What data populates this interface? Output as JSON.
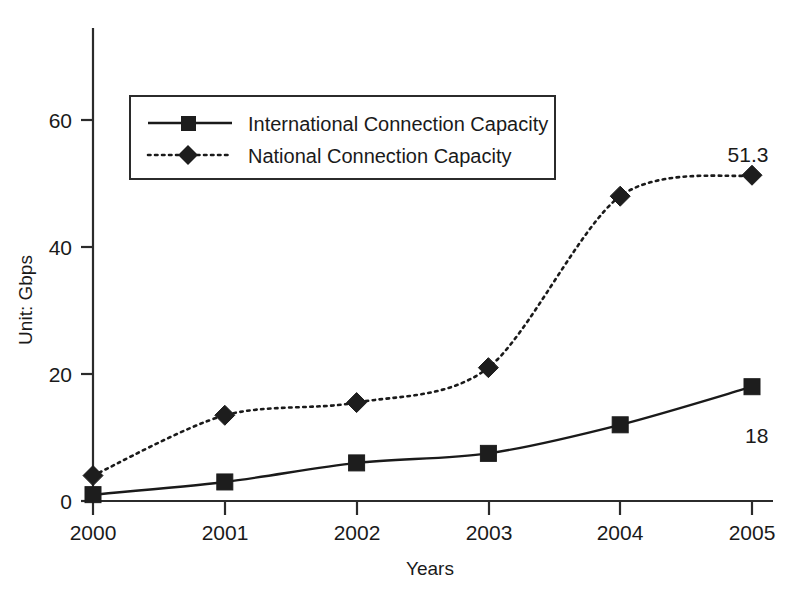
{
  "chart_data": {
    "type": "line",
    "title": "",
    "xlabel": "Years",
    "ylabel": "Unit: Gbps",
    "categories": [
      "2000",
      "2001",
      "2002",
      "2003",
      "2004",
      "2005"
    ],
    "x_tick_labels": [
      "2000",
      "2001",
      "2002",
      "2003",
      "2004",
      "2005"
    ],
    "y_tick_labels": [
      "0",
      "20",
      "40",
      "60"
    ],
    "y_ticks": [
      0,
      20,
      40,
      60
    ],
    "ylim": [
      0,
      68
    ],
    "grid": false,
    "legend_position": "upper-left-inside",
    "series": [
      {
        "name": "International Connection Capacity",
        "marker": "square",
        "line_style": "solid",
        "color": "#1a1a1a",
        "values": [
          1,
          3,
          6,
          7.5,
          12,
          18
        ]
      },
      {
        "name": "National Connection Capacity",
        "marker": "diamond",
        "line_style": "dotted",
        "color": "#1a1a1a",
        "values": [
          4,
          13.5,
          15.5,
          21,
          48,
          51.3
        ]
      }
    ],
    "annotations": [
      {
        "text": "51.3",
        "series": "National Connection Capacity",
        "category": "2005"
      },
      {
        "text": "18",
        "series": "International Connection Capacity",
        "category": "2005"
      }
    ]
  },
  "axis": {
    "y_label": "Unit: Gbps",
    "x_label": "Years",
    "y_tick_0": "0",
    "y_tick_20": "20",
    "y_tick_40": "40",
    "y_tick_60": "60",
    "x_tick_2000": "2000",
    "x_tick_2001": "2001",
    "x_tick_2002": "2002",
    "x_tick_2003": "2003",
    "x_tick_2004": "2004",
    "x_tick_2005": "2005"
  },
  "legend": {
    "entries": [
      {
        "label": "International Connection Capacity"
      },
      {
        "label": "National Connection Capacity"
      }
    ]
  },
  "labels": {
    "national_last": "51.3",
    "international_last": "18"
  }
}
